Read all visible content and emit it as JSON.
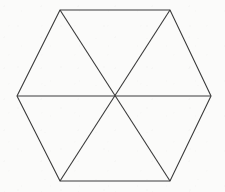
{
  "figure": {
    "name": "hexagon-divided-into-six-triangles",
    "shape_type": "polygon",
    "sides": 6,
    "triangle_count": 6,
    "diagonal_count": 3,
    "stroke_color": "#3a3a3a",
    "fill_color": "none",
    "background_color": "#fbfbfa",
    "stroke_width": 1.1,
    "canvas": {
      "width": 225,
      "height": 192
    },
    "center": {
      "label": "center",
      "x": 114,
      "y": 96
    },
    "vertices": [
      {
        "label": "left",
        "x": 17,
        "y": 96
      },
      {
        "label": "top-left",
        "x": 60,
        "y": 10
      },
      {
        "label": "top-right",
        "x": 170,
        "y": 10
      },
      {
        "label": "right",
        "x": 211,
        "y": 96
      },
      {
        "label": "bottom-right",
        "x": 170,
        "y": 181
      },
      {
        "label": "bottom-left",
        "x": 60,
        "y": 181
      }
    ],
    "outline_points": "17,96 60,10 170,10 211,96 170,181 60,181",
    "diagonals": [
      {
        "label": "horizontal-diagonal",
        "x1": 17,
        "y1": 96,
        "x2": 211,
        "y2": 96
      },
      {
        "label": "diagonal-topleft-to-bottomright",
        "x1": 60,
        "y1": 10,
        "x2": 170,
        "y2": 181
      },
      {
        "label": "diagonal-topright-to-bottomleft",
        "x1": 170,
        "y1": 10,
        "x2": 60,
        "y2": 181
      }
    ]
  }
}
